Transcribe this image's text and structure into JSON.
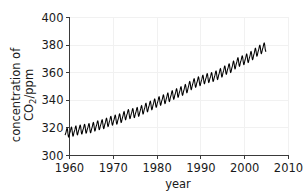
{
  "figure": {
    "background_color": "#ffffff",
    "line_color": "#000000",
    "axis_color": "#3a3a3a",
    "grid_color": "#f1f1f1"
  },
  "chart_data": {
    "type": "line",
    "title": "",
    "subtitle": "",
    "xlabel": "year",
    "ylabel_line1": "concentration of",
    "ylabel_line2_main": "CO",
    "ylabel_line2_sub": "2",
    "ylabel_line2_tail": "/ppm",
    "ylabel_full": "concentration of CO2/ppm",
    "xlim": [
      1960,
      2010
    ],
    "ylim": [
      300,
      400
    ],
    "xticks": [
      1960,
      1970,
      1980,
      1990,
      2000,
      2010
    ],
    "xticklabels": [
      "1960",
      "1970",
      "1980",
      "1990",
      "2000",
      "2010"
    ],
    "yticks": [
      300,
      320,
      340,
      360,
      380,
      400
    ],
    "yticklabels": [
      "300",
      "320",
      "340",
      "360",
      "380",
      "400"
    ],
    "grid": true,
    "legend": null,
    "legend_position": "none",
    "annotations": [],
    "series": [
      {
        "name": "Atmospheric CO2 (Mauna Loa monthly mean)",
        "description": "Keeling curve: rising trend with annual seasonal sawtooth oscillation of about 6 ppm peak-to-peak",
        "x_start": 1959.0,
        "x_end": 2004.9,
        "sampling_per_year": 12,
        "trend_anchor_years": [
          1959,
          1965,
          1970,
          1975,
          1980,
          1985,
          1990,
          1995,
          2000,
          2005
        ],
        "trend_anchor_values": [
          316.0,
          319.9,
          325.5,
          331.0,
          338.6,
          345.9,
          354.2,
          360.6,
          369.4,
          379.6
        ],
        "seasonal_amplitude_ppm": 3.0,
        "seasonal_peak_month": 5,
        "annual_values": [
          {
            "year": 1959,
            "mean": 316.0,
            "min": 313.2,
            "max": 318.7
          },
          {
            "year": 1960,
            "mean": 316.9,
            "min": 313.8,
            "max": 320.0
          },
          {
            "year": 1961,
            "mean": 317.6,
            "min": 314.6,
            "max": 320.7
          },
          {
            "year": 1962,
            "mean": 318.5,
            "min": 315.4,
            "max": 321.4
          },
          {
            "year": 1963,
            "mean": 319.0,
            "min": 316.0,
            "max": 322.2
          },
          {
            "year": 1964,
            "mean": 319.6,
            "min": 316.4,
            "max": 322.5
          },
          {
            "year": 1965,
            "mean": 319.9,
            "min": 316.9,
            "max": 322.9
          },
          {
            "year": 1966,
            "mean": 321.4,
            "min": 318.2,
            "max": 324.6
          },
          {
            "year": 1967,
            "mean": 322.2,
            "min": 319.2,
            "max": 325.4
          },
          {
            "year": 1968,
            "mean": 323.0,
            "min": 319.9,
            "max": 326.3
          },
          {
            "year": 1969,
            "mean": 324.6,
            "min": 321.4,
            "max": 327.9
          },
          {
            "year": 1970,
            "mean": 325.5,
            "min": 322.3,
            "max": 328.8
          },
          {
            "year": 1971,
            "mean": 326.3,
            "min": 323.1,
            "max": 329.6
          },
          {
            "year": 1972,
            "mean": 327.5,
            "min": 324.2,
            "max": 330.8
          },
          {
            "year": 1973,
            "mean": 329.7,
            "min": 326.3,
            "max": 333.0
          },
          {
            "year": 1974,
            "mean": 330.2,
            "min": 326.8,
            "max": 333.5
          },
          {
            "year": 1975,
            "mean": 331.0,
            "min": 327.6,
            "max": 334.4
          },
          {
            "year": 1976,
            "mean": 332.0,
            "min": 328.5,
            "max": 335.4
          },
          {
            "year": 1977,
            "mean": 333.8,
            "min": 330.3,
            "max": 337.2
          },
          {
            "year": 1978,
            "mean": 335.4,
            "min": 331.9,
            "max": 338.8
          },
          {
            "year": 1979,
            "mean": 336.8,
            "min": 333.2,
            "max": 340.3
          },
          {
            "year": 1980,
            "mean": 338.6,
            "min": 335.0,
            "max": 342.1
          },
          {
            "year": 1981,
            "mean": 340.1,
            "min": 336.5,
            "max": 343.6
          },
          {
            "year": 1982,
            "mean": 341.2,
            "min": 337.6,
            "max": 344.8
          },
          {
            "year": 1983,
            "mean": 342.8,
            "min": 339.1,
            "max": 346.4
          },
          {
            "year": 1984,
            "mean": 344.4,
            "min": 340.7,
            "max": 348.0
          },
          {
            "year": 1985,
            "mean": 345.9,
            "min": 342.2,
            "max": 349.6
          },
          {
            "year": 1986,
            "mean": 347.2,
            "min": 343.4,
            "max": 350.9
          },
          {
            "year": 1987,
            "mean": 349.2,
            "min": 345.4,
            "max": 352.9
          },
          {
            "year": 1988,
            "mean": 351.6,
            "min": 347.8,
            "max": 355.4
          },
          {
            "year": 1989,
            "mean": 353.1,
            "min": 349.2,
            "max": 356.9
          },
          {
            "year": 1990,
            "mean": 354.2,
            "min": 350.3,
            "max": 358.1
          },
          {
            "year": 1991,
            "mean": 355.6,
            "min": 351.7,
            "max": 359.5
          },
          {
            "year": 1992,
            "mean": 356.4,
            "min": 352.4,
            "max": 360.3
          },
          {
            "year": 1993,
            "mean": 357.1,
            "min": 353.1,
            "max": 361.0
          },
          {
            "year": 1994,
            "mean": 358.8,
            "min": 354.8,
            "max": 362.8
          },
          {
            "year": 1995,
            "mean": 360.6,
            "min": 356.6,
            "max": 364.7
          },
          {
            "year": 1996,
            "mean": 362.6,
            "min": 358.5,
            "max": 366.6
          },
          {
            "year": 1997,
            "mean": 363.7,
            "min": 359.6,
            "max": 367.8
          },
          {
            "year": 1998,
            "mean": 366.7,
            "min": 362.6,
            "max": 370.8
          },
          {
            "year": 1999,
            "mean": 368.4,
            "min": 364.2,
            "max": 372.5
          },
          {
            "year": 2000,
            "mean": 369.4,
            "min": 365.2,
            "max": 373.6
          },
          {
            "year": 2001,
            "mean": 371.1,
            "min": 366.9,
            "max": 375.3
          },
          {
            "year": 2002,
            "mean": 373.2,
            "min": 369.0,
            "max": 377.5
          },
          {
            "year": 2003,
            "mean": 375.8,
            "min": 371.5,
            "max": 380.1
          },
          {
            "year": 2004,
            "mean": 377.5,
            "min": 373.2,
            "max": 381.8
          }
        ]
      }
    ]
  }
}
